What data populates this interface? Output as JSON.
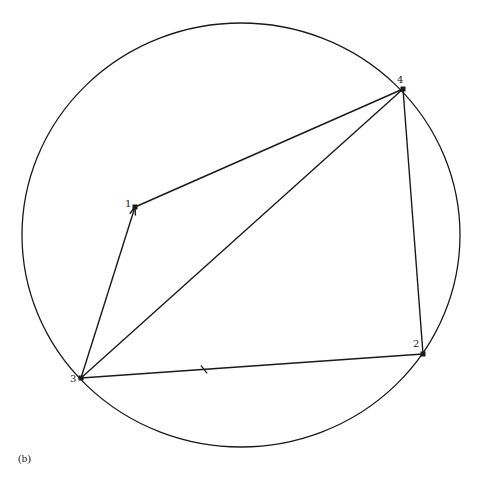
{
  "diagram": {
    "caption": "(b)",
    "circle": {
      "cx": 241,
      "cy": 235,
      "rx": 219,
      "ry": 212
    },
    "stroke_color": "#1a1a1a",
    "nodes": [
      {
        "id": "1",
        "label": "1",
        "x": 135,
        "y": 207,
        "label_dx": -10,
        "label_dy": 0
      },
      {
        "id": "2",
        "label": "2",
        "x": 423,
        "y": 354,
        "label_dx": -10,
        "label_dy": -7
      },
      {
        "id": "3",
        "label": "3",
        "x": 81,
        "y": 378,
        "label_dx": -11,
        "label_dy": 4
      },
      {
        "id": "4",
        "label": "4",
        "x": 403,
        "y": 89,
        "label_dx": -6,
        "label_dy": -6
      }
    ],
    "edges": [
      {
        "from": "3",
        "to": "1",
        "arrow_at": "1"
      },
      {
        "from": "1",
        "to": "4"
      },
      {
        "from": "3",
        "to": "4"
      },
      {
        "from": "4",
        "to": "2"
      },
      {
        "from": "3",
        "to": "2",
        "tick_mark": true
      }
    ]
  }
}
